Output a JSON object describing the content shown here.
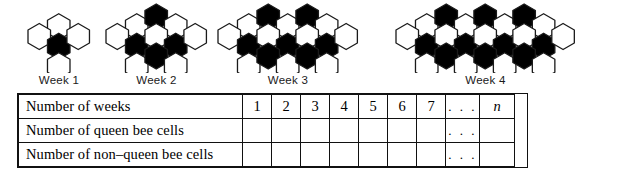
{
  "diagram": {
    "hex_fill_black": "#000000",
    "hex_fill_white": "#ffffff",
    "hex_stroke": "#1a1a1a",
    "weeks": [
      {
        "label": "Week 1",
        "week_number": 1,
        "columns": 3,
        "queen_cells": 1,
        "non_queen_cells": 6,
        "total_cells": 7,
        "black_indices": [
          [
            1,
            1
          ]
        ],
        "grid": [
          [
            0,
            1,
            0
          ],
          [
            1,
            1,
            1
          ],
          [
            0,
            1,
            0
          ]
        ]
      },
      {
        "label": "Week 2",
        "week_number": 2,
        "columns": 5,
        "queen_cells": 4,
        "non_queen_cells": 8,
        "total_cells": 12,
        "black_indices": [
          [
            0,
            2
          ],
          [
            1,
            1
          ],
          [
            1,
            3
          ],
          [
            2,
            2
          ]
        ],
        "grid": [
          [
            0,
            1,
            1,
            1,
            0
          ],
          [
            1,
            1,
            1,
            1,
            1
          ],
          [
            0,
            1,
            1,
            1,
            0
          ]
        ]
      },
      {
        "label": "Week 3",
        "week_number": 3,
        "columns": 7,
        "queen_cells": 7,
        "non_queen_cells": 10,
        "total_cells": 17,
        "black_indices": [
          [
            0,
            2
          ],
          [
            0,
            4
          ],
          [
            1,
            1
          ],
          [
            1,
            3
          ],
          [
            1,
            5
          ],
          [
            2,
            2
          ],
          [
            2,
            4
          ]
        ],
        "grid": [
          [
            0,
            1,
            1,
            1,
            1,
            1,
            0
          ],
          [
            1,
            1,
            1,
            1,
            1,
            1,
            1
          ],
          [
            0,
            1,
            1,
            1,
            1,
            1,
            0
          ]
        ]
      },
      {
        "label": "Week 4",
        "week_number": 4,
        "columns": 9,
        "queen_cells": 10,
        "non_queen_cells": 12,
        "total_cells": 22,
        "black_indices": [
          [
            0,
            2
          ],
          [
            0,
            4
          ],
          [
            0,
            6
          ],
          [
            1,
            1
          ],
          [
            1,
            3
          ],
          [
            1,
            5
          ],
          [
            1,
            7
          ],
          [
            2,
            2
          ],
          [
            2,
            4
          ],
          [
            2,
            6
          ]
        ],
        "grid": [
          [
            0,
            1,
            1,
            1,
            1,
            1,
            1,
            1,
            0
          ],
          [
            1,
            1,
            1,
            1,
            1,
            1,
            1,
            1,
            1
          ],
          [
            0,
            1,
            1,
            1,
            1,
            1,
            1,
            1,
            0
          ]
        ]
      }
    ]
  },
  "table": {
    "rows": [
      {
        "label": "Number of weeks",
        "values": [
          "1",
          "2",
          "3",
          "4",
          "5",
          "6",
          "7"
        ],
        "dots": ". . .",
        "last": "n"
      },
      {
        "label": "Number of queen bee cells",
        "values": [
          "",
          "",
          "",
          "",
          "",
          "",
          ""
        ],
        "dots": ". . .",
        "last": ""
      },
      {
        "label": "Number of non–queen bee cells",
        "values": [
          "",
          "",
          "",
          "",
          "",
          "",
          ""
        ],
        "dots": ". . .",
        "last": ""
      }
    ]
  }
}
